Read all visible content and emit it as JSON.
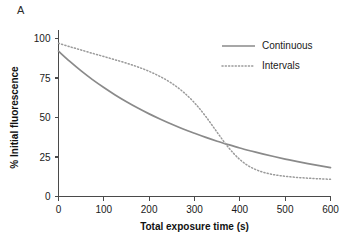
{
  "figure": {
    "panel_label": "A",
    "background_color": "#ffffff"
  },
  "chart_data": {
    "type": "line",
    "title": "",
    "panel_label": "A",
    "xlabel": "Total exposure time (s)",
    "ylabel": "% Initial fluorescence",
    "xlim": [
      0,
      600
    ],
    "ylim": [
      0,
      100
    ],
    "xticks": [
      0,
      100,
      200,
      300,
      400,
      500,
      600
    ],
    "yticks": [
      0,
      25,
      50,
      75,
      100
    ],
    "xtick_labels": [
      "0",
      "100",
      "200",
      "300",
      "400",
      "500",
      "600"
    ],
    "ytick_labels": [
      "0",
      "25",
      "50",
      "75",
      "100"
    ],
    "grid": false,
    "legend_position": "top-right",
    "x": [
      0,
      25,
      50,
      75,
      100,
      125,
      150,
      175,
      200,
      225,
      250,
      275,
      300,
      325,
      350,
      375,
      400,
      425,
      450,
      475,
      500,
      525,
      550,
      575,
      600
    ],
    "series": [
      {
        "name": "Continuous",
        "style": "solid",
        "color": "#8a8a8a",
        "values": [
          92,
          85.5,
          79.5,
          74,
          69,
          64.3,
          60,
          56,
          52.3,
          48.9,
          45.7,
          42.7,
          40,
          37.4,
          35,
          32.8,
          30.7,
          28.8,
          27,
          25.3,
          23.7,
          22.2,
          20.8,
          19.5,
          18.3
        ]
      },
      {
        "name": "Intervals",
        "style": "dotted",
        "color": "#9a9a9a",
        "values": [
          97,
          94.8,
          92.7,
          90.6,
          88.6,
          86.5,
          84.4,
          82,
          79.2,
          75.8,
          71.6,
          66.2,
          59.3,
          50.6,
          40.6,
          31,
          23.4,
          18.4,
          15.5,
          13.8,
          12.8,
          12.1,
          11.6,
          11.2,
          10.9
        ]
      }
    ],
    "legend_entries": [
      {
        "label": "Continuous",
        "style": "solid",
        "color": "#8a8a8a"
      },
      {
        "label": "Intervals",
        "style": "dotted",
        "color": "#9a9a9a"
      }
    ]
  }
}
